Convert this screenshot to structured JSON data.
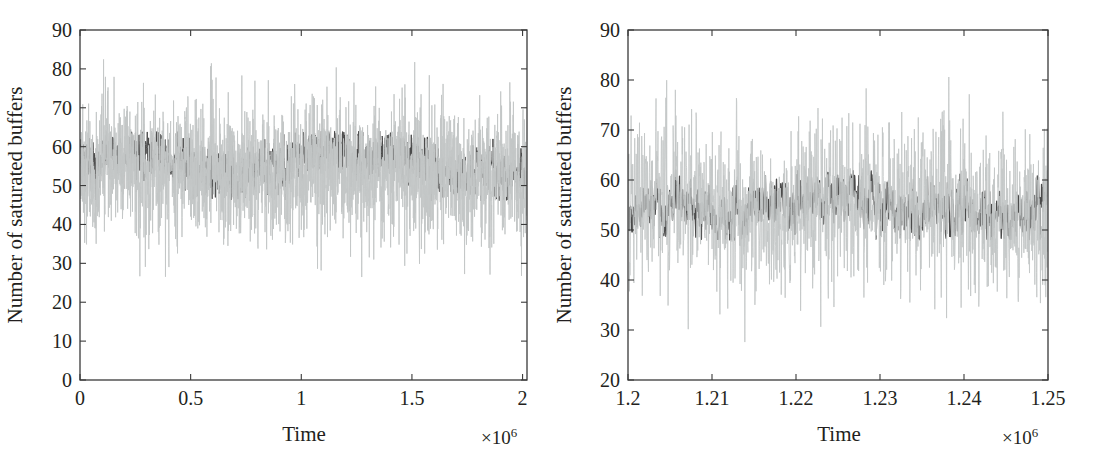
{
  "figure": {
    "background_color": "#ffffff",
    "panel_count": 2
  },
  "style": {
    "axis_color": "#3a3a3a",
    "series_light_color": "#c3c6c6",
    "series_dark_color": "#4a4a4a",
    "text_color": "#231f20"
  },
  "panels": {
    "left": {
      "name": "full-run-time-series",
      "y_axis_title": "Number of saturated buffers",
      "x_axis_title": "Time",
      "x_exponent_prefix": "×10",
      "x_exponent_value": "6",
      "y_ticks": [
        "0",
        "10",
        "20",
        "30",
        "40",
        "50",
        "60",
        "70",
        "80",
        "90"
      ],
      "x_ticks": [
        "0",
        "0.5",
        "1",
        "1.5",
        "2"
      ]
    },
    "right": {
      "name": "zoomed-window-time-series",
      "y_axis_title": "Number of saturated buffers",
      "x_axis_title": "Time",
      "x_exponent_prefix": "×10",
      "x_exponent_value": "6",
      "y_ticks": [
        "20",
        "30",
        "40",
        "50",
        "60",
        "70",
        "80",
        "90"
      ],
      "x_ticks": [
        "1.2",
        "1.21",
        "1.22",
        "1.23",
        "1.24",
        "1.25"
      ]
    }
  },
  "chart_data": [
    {
      "type": "line",
      "name": "full-run-time-series",
      "title": "",
      "xlabel": "Time",
      "ylabel": "Number of saturated buffers",
      "x_multiplier": 1000000,
      "x_multiplier_label": "×10^6",
      "xlim": [
        0,
        2.02
      ],
      "ylim": [
        0,
        90
      ],
      "xticks": [
        0,
        0.5,
        1,
        1.5,
        2
      ],
      "xticklabels": [
        "0",
        "0.5",
        "1",
        "1.5",
        "2"
      ],
      "yticks": [
        0,
        10,
        20,
        30,
        40,
        50,
        60,
        70,
        80,
        90
      ],
      "yticklabels": [
        "0",
        "10",
        "20",
        "30",
        "40",
        "50",
        "60",
        "70",
        "80",
        "90"
      ],
      "grid": false,
      "legend": "none",
      "series": [
        {
          "name": "light-gray-trace",
          "color": "#c3c6c6",
          "mean": 54,
          "band_min": 26,
          "band_max": 84,
          "typical_min": 34,
          "typical_max": 74,
          "noise_sigma": 8.5,
          "description": "High-variance fluctuating signal spanning roughly 26 to 84 saturated buffers across the whole run"
        },
        {
          "name": "dark-gray-trace",
          "color": "#4a4a4a",
          "mean": 55,
          "band_min": 46,
          "band_max": 64,
          "typical_min": 49,
          "typical_max": 62,
          "noise_sigma": 3.2,
          "description": "Lower-variance fluctuating signal forming a dense band between roughly 49 and 62 saturated buffers"
        }
      ]
    },
    {
      "type": "line",
      "name": "zoomed-window-time-series",
      "title": "",
      "xlabel": "Time",
      "ylabel": "Number of saturated buffers",
      "x_multiplier": 1000000,
      "x_multiplier_label": "×10^6",
      "xlim": [
        1.2,
        1.25
      ],
      "ylim": [
        20,
        90
      ],
      "xticks": [
        1.2,
        1.21,
        1.22,
        1.23,
        1.24,
        1.25
      ],
      "xticklabels": [
        "1.2",
        "1.21",
        "1.22",
        "1.23",
        "1.24",
        "1.25"
      ],
      "yticks": [
        20,
        30,
        40,
        50,
        60,
        70,
        80,
        90
      ],
      "yticklabels": [
        "20",
        "30",
        "40",
        "50",
        "60",
        "70",
        "80",
        "90"
      ],
      "grid": false,
      "legend": "none",
      "series": [
        {
          "name": "light-gray-trace",
          "color": "#c3c6c6",
          "mean": 54,
          "band_min": 27,
          "band_max": 85,
          "typical_min": 36,
          "typical_max": 74,
          "noise_sigma": 8.2,
          "description": "High-variance trace with frequent spikes up to about 85 and dips down to about 27"
        },
        {
          "name": "dark-gray-trace",
          "color": "#4a4a4a",
          "mean": 54,
          "band_min": 48,
          "band_max": 62,
          "typical_min": 50,
          "typical_max": 60,
          "noise_sigma": 2.6,
          "description": "Smoother low-variance trace oscillating mostly between 50 and 60"
        }
      ]
    }
  ]
}
